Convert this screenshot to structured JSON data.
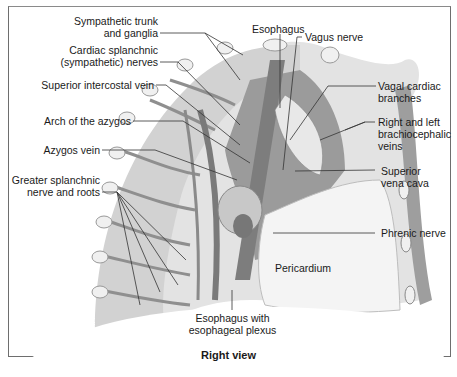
{
  "figure": {
    "view_caption": "Right view",
    "colors": {
      "background": "#ffffff",
      "frame_border": "#6e6e6e",
      "tissue_light": "#d9d9d9",
      "tissue_mid": "#a8a8a8",
      "vessel_dark": "#8c8c8c",
      "pericardium": "#f3f3f3",
      "label_text": "#1a1a1a",
      "leader_line": "#333333"
    }
  },
  "labels": {
    "left": [
      {
        "id": "sympathetic-trunk",
        "line1": "Sympathetic trunk",
        "line2": "and ganglia"
      },
      {
        "id": "cardiac-splanchnic",
        "line1": "Cardiac splanchnic",
        "line2": "(sympathetic) nerves"
      },
      {
        "id": "superior-intercostal-vein",
        "line1": "Superior intercostal vein"
      },
      {
        "id": "arch-of-azygos",
        "line1": "Arch of the azygos"
      },
      {
        "id": "azygos-vein",
        "line1": "Azygos vein"
      },
      {
        "id": "greater-splanchnic",
        "line1": "Greater splanchnic",
        "line2": "nerve and roots"
      }
    ],
    "top": [
      {
        "id": "esophagus",
        "line1": "Esophagus"
      },
      {
        "id": "vagus-nerve",
        "line1": "Vagus nerve"
      }
    ],
    "right": [
      {
        "id": "vagal-cardiac-branches",
        "line1": "Vagal cardiac",
        "line2": "branches"
      },
      {
        "id": "brachiocephalic-veins",
        "line1": "Right and left",
        "line2": "brachiocephalic",
        "line3": "veins"
      },
      {
        "id": "superior-vena-cava",
        "line1": "Superior",
        "line2": "vena cava"
      },
      {
        "id": "phrenic-nerve",
        "line1": "Phrenic nerve"
      }
    ],
    "inner": [
      {
        "id": "pericardium",
        "line1": "Pericardium"
      }
    ],
    "bottom": [
      {
        "id": "esophagus-plexus",
        "line1": "Esophagus with",
        "line2": "esophageal plexus"
      }
    ]
  }
}
